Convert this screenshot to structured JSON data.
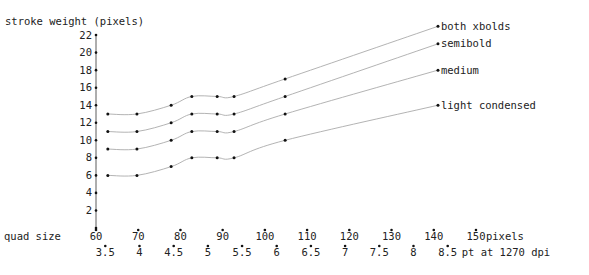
{
  "chart_data": {
    "type": "line",
    "title": "",
    "ylabel": "stroke weight (pixels)",
    "xlabel": "quad size",
    "x_unit_label": "pixels",
    "x2_unit_label": "pt at 1270 dpi",
    "ylim": [
      0,
      22
    ],
    "xlim": [
      60,
      150
    ],
    "y_ticks": [
      2,
      4,
      6,
      8,
      10,
      12,
      14,
      16,
      18,
      20,
      22
    ],
    "x_ticks": [
      60,
      70,
      80,
      90,
      100,
      110,
      120,
      130,
      140,
      150
    ],
    "x2_ticks": [
      "3.5",
      "4",
      "4.5",
      "5",
      "5.5",
      "6",
      "6.5",
      "7",
      "7.5",
      "8",
      "8.5"
    ],
    "x2_tick_positions": [
      62.2,
      70.3,
      78.4,
      86.5,
      94.6,
      102.8,
      110.9,
      119.0,
      127.1,
      135.2,
      143.3
    ],
    "grid": false,
    "legend_position": "inline-right",
    "x": [
      62.8,
      69.7,
      77.8,
      82.7,
      88.7,
      92.7,
      104.8,
      141.0
    ],
    "series": [
      {
        "name": "both xbolds",
        "values": [
          13,
          13,
          14,
          15,
          15,
          15,
          17,
          23
        ]
      },
      {
        "name": "semibold",
        "values": [
          11,
          11,
          12,
          13,
          13,
          13,
          15,
          21
        ]
      },
      {
        "name": "medium",
        "values": [
          9,
          9,
          10,
          11,
          11,
          11,
          13,
          18
        ]
      },
      {
        "name": "light condensed",
        "values": [
          6,
          6,
          7,
          8,
          8,
          8,
          10,
          14
        ]
      }
    ]
  }
}
